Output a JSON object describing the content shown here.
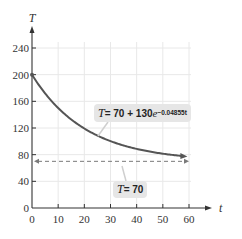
{
  "chart_data": {
    "type": "line",
    "title": "",
    "xlabel": "t",
    "ylabel": "T",
    "xlim": [
      0,
      60
    ],
    "ylim": [
      0,
      240
    ],
    "x_ticks": [
      0,
      10,
      20,
      30,
      40,
      50,
      60
    ],
    "y_ticks": [
      0,
      40,
      80,
      120,
      160,
      200,
      240
    ],
    "x_tick_labels": [
      "0",
      "10",
      "20",
      "30",
      "40",
      "50",
      "60"
    ],
    "y_tick_labels": [
      "0",
      "40",
      "80",
      "120",
      "160",
      "200",
      "240"
    ],
    "grid": true,
    "series": [
      {
        "name": "T = 70 + 130e^(-0.04855t)",
        "style": "solid",
        "color": "#555555",
        "x": [
          0,
          5,
          10,
          15,
          20,
          25,
          30,
          35,
          40,
          45,
          50,
          55,
          60
        ],
        "values": [
          200,
          171.3,
          150.8,
          132.5,
          119.4,
          108.5,
          99.9,
          93.2,
          88.7,
          84.6,
          81.4,
          78.9,
          77.0
        ]
      },
      {
        "name": "T = 70",
        "style": "dashed",
        "color": "#777777",
        "x": [
          0,
          60
        ],
        "values": [
          70,
          70
        ]
      }
    ],
    "annotations": [
      {
        "text": "T = 70 + 130e^(-0.04855t)",
        "target": "curve"
      },
      {
        "text": "T = 70",
        "target": "asymptote"
      }
    ],
    "legend": "none"
  },
  "labels": {
    "y_axis_title": "T",
    "x_axis_title": "t",
    "eq_curve": {
      "lhs": "T",
      "equals": " = 70 + 130",
      "e": "e",
      "exponent": "−0.04855t"
    },
    "eq_asymptote": {
      "lhs": "T",
      "rhs": " = 70"
    }
  },
  "colors": {
    "curve": "#555555",
    "asymptote": "#7a7a7a",
    "grid": "#e8e8e8",
    "axis": "#333333",
    "label_box": "#e6e6e6"
  }
}
